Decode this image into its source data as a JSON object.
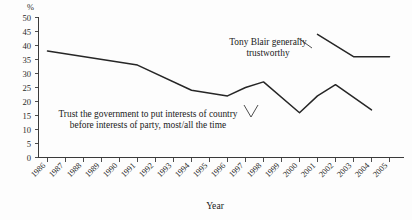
{
  "chart_data": {
    "type": "line",
    "title": "",
    "xlabel": "Year",
    "ylabel": "%",
    "ylim": [
      0,
      50
    ],
    "ytick_step": 5,
    "yticks": [
      "0",
      "5",
      "10",
      "15",
      "20",
      "25",
      "30",
      "35",
      "40",
      "45",
      "50"
    ],
    "grid": false,
    "legend": "none",
    "categories": [
      "1986",
      "1987",
      "1988",
      "1989",
      "1990",
      "1991",
      "1992",
      "1993",
      "1994",
      "1995",
      "1996",
      "1997",
      "1998",
      "1999",
      "2000",
      "2001",
      "2002",
      "2003",
      "2004",
      "2005"
    ],
    "series": [
      {
        "name": "Trust the government to put interests of country before interests of party, most/all the time",
        "x": [
          "1986",
          "1991",
          "1994",
          "1996",
          "1997",
          "1998",
          "2000",
          "2001",
          "2002",
          "2004"
        ],
        "values": [
          38,
          33,
          24,
          22,
          25,
          27,
          16,
          22,
          26,
          17
        ]
      },
      {
        "name": "Tony Blair generally trustworthy",
        "x": [
          "2001",
          "2003",
          "2005"
        ],
        "values": [
          44,
          36,
          36
        ]
      }
    ],
    "annotations": [
      {
        "id": "blair-annotation",
        "line1": "Tony Blair generally",
        "line2": "trustworthy"
      },
      {
        "id": "trust-annotation",
        "line1": "Trust the government to put interests of country",
        "line2": "before interests of party, most/all the time"
      }
    ],
    "colors": {
      "line": "#262626",
      "axis": "#3a3a3a",
      "text": "#1b1b1b",
      "background": "#fdfdfd"
    }
  }
}
